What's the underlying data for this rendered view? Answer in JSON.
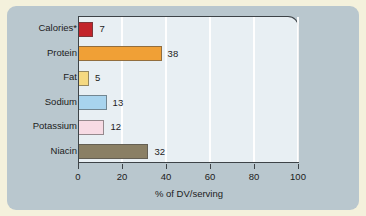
{
  "figure": {
    "matte_color": "#f4f1dc",
    "panel_color": "#b9c7ce",
    "plot_background": "#e8eff3",
    "axis_color": "#3d4347",
    "gridline_color": "#ffffff"
  },
  "chart_data": {
    "type": "bar",
    "orientation": "horizontal",
    "title": "",
    "xlabel": "% of DV/serving",
    "ylabel": "",
    "categories": [
      "Calories*",
      "Protein",
      "Fat",
      "Sodium",
      "Potassium",
      "Niacin"
    ],
    "values": [
      7,
      38,
      5,
      13,
      12,
      32
    ],
    "value_labels": [
      "7",
      "38",
      "5",
      "13",
      "12",
      "32"
    ],
    "bar_colors": [
      "#c2242a",
      "#f0a036",
      "#f5d981",
      "#a8d4ee",
      "#f7dbe4",
      "#8a7f64"
    ],
    "xlim": [
      0,
      100
    ],
    "xticks": [
      0,
      20,
      40,
      60,
      80,
      100
    ],
    "xticklabels": [
      "0",
      "20",
      "40",
      "60",
      "80",
      "100"
    ],
    "grid": true,
    "grid_axis": "x",
    "legend": false,
    "series": [
      {
        "name": "% of DV/serving",
        "points": [
          {
            "category": "Calories*",
            "value": 7,
            "color": "#c2242a"
          },
          {
            "category": "Protein",
            "value": 38,
            "color": "#f0a036"
          },
          {
            "category": "Fat",
            "value": 5,
            "color": "#f5d981"
          },
          {
            "category": "Sodium",
            "value": 13,
            "color": "#a8d4ee"
          },
          {
            "category": "Potassium",
            "value": 12,
            "color": "#f7dbe4"
          },
          {
            "category": "Niacin",
            "value": 32,
            "color": "#8a7f64"
          }
        ]
      }
    ]
  }
}
